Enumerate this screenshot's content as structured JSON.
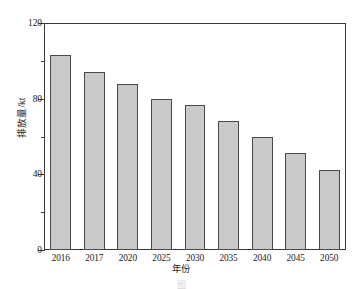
{
  "chart_data": {
    "type": "bar",
    "title": "",
    "xlabel": "年份",
    "ylabel": "排放量/kt",
    "categories": [
      "2016",
      "2017",
      "2020",
      "2025",
      "2030",
      "2035",
      "2040",
      "2045",
      "2050"
    ],
    "values": [
      103,
      94,
      88,
      80,
      76.5,
      68,
      59.5,
      51.5,
      42.5
    ],
    "ylim": [
      0,
      120
    ],
    "y_ticks": [
      0,
      40,
      80,
      120
    ],
    "y_tick_labels": [
      "0",
      "40",
      "80",
      "120"
    ],
    "y_minor_ticks": [
      20,
      60,
      100
    ],
    "grid": false,
    "legend": false,
    "bar_fill_color": "#c9c9c9",
    "bar_edge_color": "#4a4a4a",
    "frame_color": "#3a3a3a"
  },
  "caption": {
    "text": "图"
  }
}
